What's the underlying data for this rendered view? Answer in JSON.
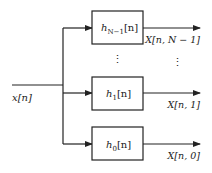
{
  "diagram": {
    "type": "filter-bank block diagram",
    "input": {
      "label": "x[n]",
      "var": "x",
      "idx": "n"
    },
    "branches": [
      {
        "filter": {
          "base": "h",
          "sub": "N−1",
          "arg": "[n]"
        },
        "output": "X[n, N − 1]"
      },
      {
        "filter": {
          "base": "h",
          "sub": "1",
          "arg": "[n]"
        },
        "output": "X[n, 1]"
      },
      {
        "filter": {
          "base": "h",
          "sub": "0",
          "arg": "[n]"
        },
        "output": "X[n, 0]"
      }
    ],
    "ellipsis": "⋮",
    "colors": {
      "line": "#222222",
      "background": "#ffffff"
    }
  }
}
